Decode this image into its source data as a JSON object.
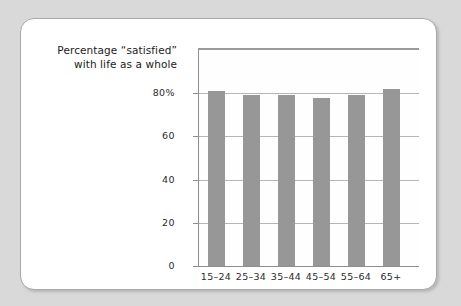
{
  "chart_data": {
    "type": "bar",
    "title_lines": [
      "Percentage “satisfied”",
      "with life as a whole"
    ],
    "categories": [
      "15–24",
      "25–34",
      "35–44",
      "45–54",
      "55–64",
      "65+"
    ],
    "values": [
      81,
      79,
      79,
      78,
      79,
      82
    ],
    "xlabel": "Age group",
    "ylabel": "",
    "ylim": [
      0,
      100
    ],
    "yticks": [
      0,
      20,
      40,
      60,
      80
    ],
    "ytick_labels": [
      "0",
      "20",
      "40",
      "60",
      "80%"
    ],
    "grid": true,
    "legend": false,
    "bar_color": "#979797",
    "gridline_color": "#b6b6b6",
    "axis_color": "#8e8e8e",
    "background_color": "#ffffff",
    "page_background_color": "#d9d9d9"
  }
}
